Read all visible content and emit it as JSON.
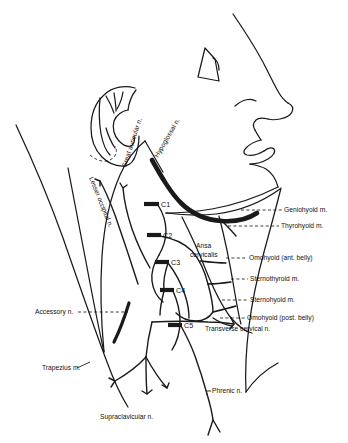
{
  "figure": {
    "background_color": "#ffffff",
    "ink_color": "#1a1a1a",
    "width": 348,
    "height": 443
  },
  "right_labels": [
    {
      "id": "geniohyoid",
      "text": "Geniohyoid m.",
      "x": 284,
      "y": 212
    },
    {
      "id": "thyrohyoid",
      "text": "Thyrohyoid m.",
      "x": 281,
      "y": 228
    },
    {
      "id": "omohyoid_ant",
      "text": "Omohyoid (ant. belly)",
      "x": 249,
      "y": 260
    },
    {
      "id": "sternothyroid",
      "text": "Sternothyroid m.",
      "x": 250,
      "y": 281
    },
    {
      "id": "sternohyoid",
      "text": "Sternohyoid m.",
      "x": 250,
      "y": 302
    },
    {
      "id": "omohyoid_post",
      "text": "Omohyoid (post. belly)",
      "x": 247,
      "y": 320
    },
    {
      "id": "transverse_cervical",
      "text": "Transverse cervical n.",
      "x": 205,
      "y": 331
    }
  ],
  "left_labels": [
    {
      "id": "accessory",
      "text": "Accessory n.",
      "x": 35,
      "y": 314
    },
    {
      "id": "trapezius",
      "text": "Trapezius m.",
      "x": 42,
      "y": 370
    }
  ],
  "bottom_labels": [
    {
      "id": "supraclavicular",
      "text": "Supraclavicular n.",
      "x": 100,
      "y": 419
    },
    {
      "id": "phrenic",
      "text": "Phrenic n.",
      "x": 212,
      "y": 393
    }
  ],
  "rotated_labels": [
    {
      "id": "lesser_occipital",
      "text": "Lesser occipital n.",
      "x": 89,
      "y": 178,
      "rotate": 68
    },
    {
      "id": "great_auricular",
      "text": "Great auricular n.",
      "x": 126,
      "y": 168,
      "rotate": -72
    },
    {
      "id": "hypoglossal",
      "text": "Hypoglossal n.",
      "x": 158,
      "y": 158,
      "rotate": -60
    }
  ],
  "center_label": {
    "id": "ansa_cervicalis",
    "line1": "Ansa",
    "line2": "cervicalis",
    "x": 196,
    "y": 248
  },
  "cervical_roots": [
    {
      "id": "c1",
      "text": "C1",
      "bar_x1": 144,
      "bar_x2": 159,
      "bar_y": 204,
      "text_x": 161,
      "text_y": 207
    },
    {
      "id": "c2",
      "text": "C2",
      "bar_x1": 147,
      "bar_x2": 161,
      "bar_y": 235,
      "text_x": 163,
      "text_y": 238
    },
    {
      "id": "c3",
      "text": "C3",
      "bar_x1": 155,
      "bar_x2": 169,
      "bar_y": 262,
      "text_x": 171,
      "text_y": 265
    },
    {
      "id": "c4",
      "text": "C4",
      "bar_x1": 160,
      "bar_x2": 174,
      "bar_y": 290,
      "text_x": 176,
      "text_y": 293
    },
    {
      "id": "c5",
      "text": "C5",
      "bar_x1": 168,
      "bar_x2": 182,
      "bar_y": 325,
      "text_x": 184,
      "text_y": 328
    }
  ]
}
